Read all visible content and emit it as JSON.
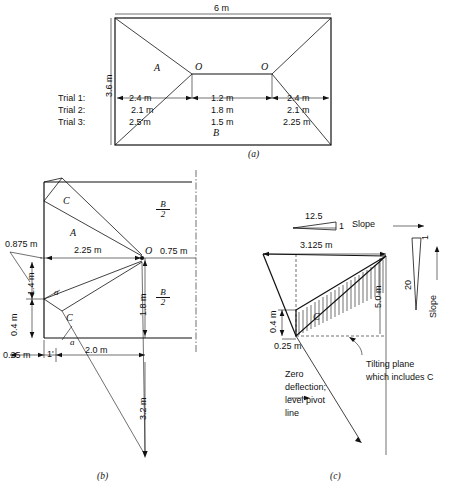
{
  "figure": {
    "title_implicit": "Footing trial layout and tilting plane diagram",
    "captions": {
      "a": "(a)",
      "b": "(b)",
      "c": "(c)"
    }
  },
  "panel_a": {
    "caption": "(a)",
    "top_dimension": "6 m",
    "left_dimension": "3.6 m",
    "region_label_upper": "A",
    "region_label_lower": "B",
    "node_left": "O",
    "node_right": "O",
    "trials": [
      {
        "name": "Trial 1:",
        "left": "2.4 m",
        "middle": "1.2 m",
        "right": "2.4 m"
      },
      {
        "name": "Trial 2:",
        "left": "2.1 m",
        "middle": "1.8 m",
        "right": "2.1 m"
      },
      {
        "name": "Trial 3:",
        "left": "2.5'm",
        "middle": "1.5 m",
        "right": "2.25 m"
      }
    ]
  },
  "panel_b": {
    "caption": "(b)",
    "dim_left_offset": "0.875 m",
    "dim_horizontal_main": "2.25 m",
    "dim_right_offset": "0.75 m",
    "dim_vertical_upper": "1.4 m",
    "dim_vertical_lower": "0.4 m",
    "dim_vertical_right": "1.8 m",
    "dim_bottom_offset": "0.25 m",
    "dim_bottom_main": "2.0 m",
    "dim_vertical_long": "3.2 m",
    "region_label_A": "A",
    "region_label_C_upper": "C",
    "region_label_C_lower": "C",
    "node_O": "O",
    "angle_upper": "a",
    "angle_lower": "a",
    "tick_label": "1'",
    "half_label_upper_num": "B",
    "half_label_upper_den": "2",
    "half_label_lower_num": "B",
    "half_label_lower_den": "2"
  },
  "panel_c": {
    "caption": "(c)",
    "slope_h_rise": "12.5",
    "slope_h_run": "1",
    "slope_h_label": "Slope",
    "slope_v_rise": "1",
    "slope_v_run": "20",
    "slope_v_label": "Slope",
    "dim_top": "3.125 m",
    "dim_right": "5.0 m",
    "dim_vertical_small": "0.4 m",
    "dim_bottom": "0.25 m",
    "region_label_C": "C",
    "annotation_left": "Zero deflection; level pivot line",
    "annotation_left_lines": [
      "Zero",
      "deflection;",
      "level pivot",
      "line"
    ],
    "annotation_right_lines": [
      "Tilting plane",
      "which includes C"
    ]
  },
  "colors": {
    "ink": "#111111",
    "paper": "#ffffff"
  }
}
